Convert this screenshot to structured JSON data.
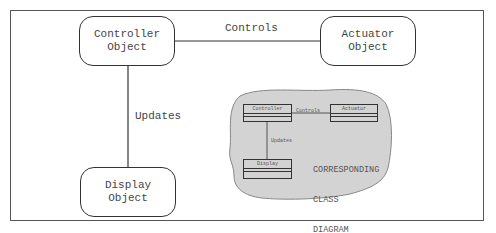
{
  "diagram": {
    "objects": [
      {
        "id": "controller",
        "lines": [
          "Controller",
          "Object"
        ]
      },
      {
        "id": "actuator",
        "lines": [
          "Actuator",
          "Object"
        ]
      },
      {
        "id": "display",
        "lines": [
          "Display",
          "Object"
        ]
      }
    ],
    "relations": {
      "controls": "Controls",
      "updates": "Updates"
    },
    "class_diagram": {
      "classes": [
        "Controller",
        "Actuator",
        "Display"
      ],
      "controls": "Controls",
      "updates": "Updates",
      "note_lines": [
        "CORRESPONDING",
        "CLASS",
        "DIAGRAM",
        "(the plan)"
      ],
      "fill_color": "#d3d3d3"
    }
  }
}
